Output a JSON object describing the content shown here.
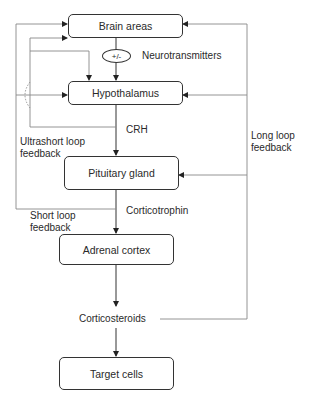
{
  "diagram": {
    "type": "flowchart",
    "title": "",
    "nodes": {
      "brain_areas": "Brain areas",
      "hypothalamus": "Hypothalamus",
      "pituitary_gland": "Pituitary gland",
      "adrenal_cortex": "Adrenal cortex",
      "target_cells": "Target cells"
    },
    "modulator": "+/-",
    "labels": {
      "neurotransmitters": "Neurotransmitters",
      "crh": "CRH",
      "corticotrophin": "Corticotrophin",
      "corticosteroids": "Corticosteroids",
      "ultrashort_loop_1": "Ultrashort loop",
      "ultrashort_loop_2": "feedback",
      "short_loop_1": "Short loop",
      "short_loop_2": "feedback",
      "long_loop_1": "Long loop",
      "long_loop_2": "feedback"
    },
    "edges": [
      {
        "from": "Brain areas",
        "to": "Hypothalamus",
        "label": "Neurotransmitters (+/-)"
      },
      {
        "from": "Hypothalamus",
        "to": "Pituitary gland",
        "label": "CRH"
      },
      {
        "from": "Pituitary gland",
        "to": "Adrenal cortex",
        "label": "Corticotrophin"
      },
      {
        "from": "Adrenal cortex",
        "to": "Corticosteroids"
      },
      {
        "from": "Corticosteroids",
        "to": "Target cells"
      },
      {
        "from": "Corticosteroids",
        "to": [
          "Brain areas",
          "Hypothalamus",
          "Pituitary gland"
        ],
        "label": "Long loop feedback"
      },
      {
        "from": "Pituitary gland",
        "to": [
          "Brain areas",
          "Hypothalamus"
        ],
        "label": "Short loop feedback"
      },
      {
        "from": "Hypothalamus",
        "to": [
          "Brain areas",
          "Hypothalamus"
        ],
        "label": "Ultrashort loop feedback"
      }
    ]
  }
}
